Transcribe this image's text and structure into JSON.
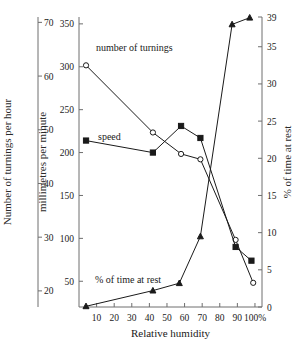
{
  "chart_data": {
    "type": "line",
    "title": "",
    "xlabel": "Relative humidity",
    "grid": false,
    "legend": "inline-annotations",
    "x_ticks": [
      "10",
      "20",
      "30",
      "40",
      "50",
      "60",
      "70",
      "80",
      "90",
      "100%"
    ],
    "x_tick_values": [
      10,
      20,
      30,
      40,
      50,
      60,
      70,
      80,
      90,
      100
    ],
    "xlim": [
      0,
      104
    ],
    "axes": [
      {
        "id": "left-outer",
        "label": "Number of turnings per hour",
        "ticks": [
          "20",
          "30",
          "40",
          "50",
          "60",
          "70"
        ],
        "tick_values": [
          20,
          30,
          40,
          50,
          60,
          70
        ],
        "lim": [
          17,
          71
        ]
      },
      {
        "id": "left-inner",
        "label": "millimetres per minute",
        "ticks": [
          "50",
          "100",
          "150",
          "200",
          "250",
          "300",
          "350"
        ],
        "tick_values": [
          50,
          100,
          150,
          200,
          250,
          300,
          350
        ],
        "lim": [
          20,
          358
        ]
      },
      {
        "id": "right",
        "label": "% of time at rest",
        "ticks": [
          "0",
          "5",
          "10",
          "15",
          "20",
          "25",
          "30",
          "35",
          "39"
        ],
        "tick_values": [
          0,
          5,
          10,
          15,
          20,
          25,
          30,
          35,
          39
        ],
        "lim": [
          0,
          39
        ]
      }
    ],
    "series": [
      {
        "name": "number of turnings",
        "label": "number of turnings",
        "marker": "open-circle",
        "axis": "left-outer",
        "x": [
          4,
          42,
          58,
          69,
          89,
          99
        ],
        "values": [
          62,
          49.5,
          45.5,
          44.5,
          29.5,
          21.5
        ]
      },
      {
        "name": "speed",
        "label": "speed",
        "marker": "filled-square",
        "axis": "left-inner",
        "x": [
          4,
          42,
          58,
          69,
          89,
          98
        ],
        "values": [
          214,
          200,
          231,
          217,
          90,
          74
        ]
      },
      {
        "name": "% of time at rest",
        "label": "% of time at rest",
        "marker": "triangle",
        "axis": "right",
        "x": [
          4,
          42,
          57,
          69,
          87,
          97
        ],
        "values": [
          0.1,
          2.2,
          3.2,
          9.5,
          38.0,
          38.9
        ]
      }
    ],
    "colors": {
      "ink": "#1a1a1a",
      "spine": "#6e6e6e",
      "background": "#ffffff"
    }
  }
}
